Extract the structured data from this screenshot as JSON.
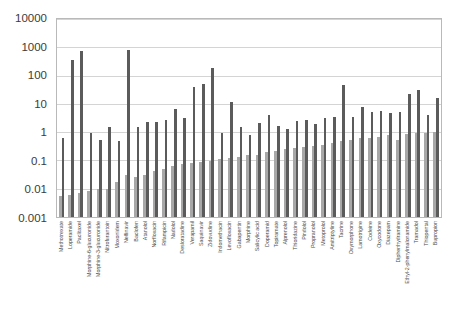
{
  "chart_data": {
    "type": "bar",
    "title": "",
    "subtitle": "",
    "xlabel": "",
    "ylabel": "",
    "yscale": "log",
    "ylim": [
      0.001,
      10000
    ],
    "ytick_labels": [
      "10000",
      "1000",
      "100",
      "10",
      "1",
      "0.1",
      "0.01",
      "0.001"
    ],
    "ytick_values": [
      10000,
      1000,
      100,
      10,
      1,
      0.1,
      0.01,
      0.001
    ],
    "grid": "horizontal",
    "legend": "none",
    "legend_entries": [],
    "colors": {
      "series_light": "#a8a8a8",
      "series_dark": "#5b5b5b",
      "grid": "#d4d4d4",
      "frame": "#b9b9b9"
    },
    "categories": [
      "Methotrexate",
      "Loperamide",
      "Paclitaxel",
      "Morphine-6-glucuronide",
      "Morphine-3-glucuronide",
      "Nitrofurantoin",
      "Moxonidem",
      "Nelfinavir",
      "Baclofen",
      "Atanolol",
      "Norfloxacin",
      "Rifampicin",
      "Nadolol",
      "Desloratadine",
      "Verapamil",
      "Saquinavir",
      "Zidovudine",
      "Indomethacin",
      "Levofloxacin",
      "Gabapentin",
      "Morphine",
      "Salicylic acid",
      "Doperamid",
      "Topiramate",
      "Alprenolol",
      "Thioridazine",
      "Pindolol",
      "Propranolol",
      "Metoprolol",
      "Amitriptyline",
      "Tacrine",
      "Oxymorphone",
      "Lamotrigine",
      "Codeine",
      "Oxycodone",
      "Diazepam",
      "Diphenhydramine",
      "Ethyl-2-phenylmalonamide",
      "Tramadol",
      "Thiopental",
      "Bupropion"
    ],
    "series": [
      {
        "name": "series-light",
        "values": [
          0.0055,
          0.0062,
          0.0068,
          0.008,
          0.01,
          0.01,
          0.018,
          0.03,
          0.027,
          0.03,
          0.042,
          0.048,
          0.065,
          0.075,
          0.08,
          0.085,
          0.095,
          0.11,
          0.12,
          0.13,
          0.15,
          0.16,
          0.2,
          0.22,
          0.25,
          0.27,
          0.3,
          0.33,
          0.36,
          0.42,
          0.5,
          0.55,
          0.6,
          0.62,
          0.7,
          0.78,
          0.55,
          0.85,
          0.9,
          0.95,
          1.05
        ]
      },
      {
        "name": "series-dark",
        "values": [
          0.62,
          350,
          760,
          0.95,
          0.55,
          1.5,
          0.5,
          800,
          1.5,
          2.3,
          2.3,
          2.7,
          6.5,
          3.2,
          38,
          50,
          190,
          0.95,
          12,
          1.5,
          0.8,
          2.1,
          4.0,
          1.7,
          1.3,
          2.4,
          2.6,
          1.9,
          3.1,
          3.3,
          45,
          3.3,
          8.0,
          5.2,
          5.5,
          4.6,
          5.3,
          22,
          30,
          4.2,
          16
        ]
      }
    ]
  }
}
